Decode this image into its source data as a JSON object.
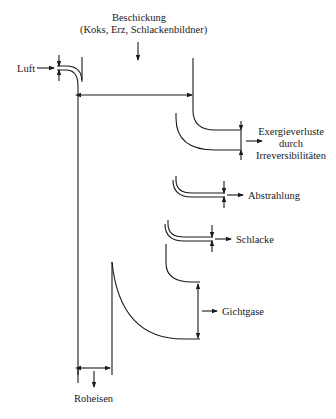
{
  "diagram": {
    "type": "exergy-flow (Sankey-like) diagram of a blast furnace",
    "inputs": {
      "top": {
        "title": "Beschickung",
        "subtitle": "(Koks, Erz, Schlackenbildner)"
      },
      "left": {
        "label": "Luft"
      }
    },
    "outputs": [
      {
        "label_lines": [
          "Exergieverluste",
          "durch",
          "Irreversibilitäten"
        ]
      },
      {
        "label": "Abstrahlung"
      },
      {
        "label": "Schlacke"
      },
      {
        "label": "Gichtgase"
      },
      {
        "label": "Roheisen"
      }
    ],
    "colors": {
      "line": "#1a1a1a",
      "background": "#ffffff"
    }
  }
}
